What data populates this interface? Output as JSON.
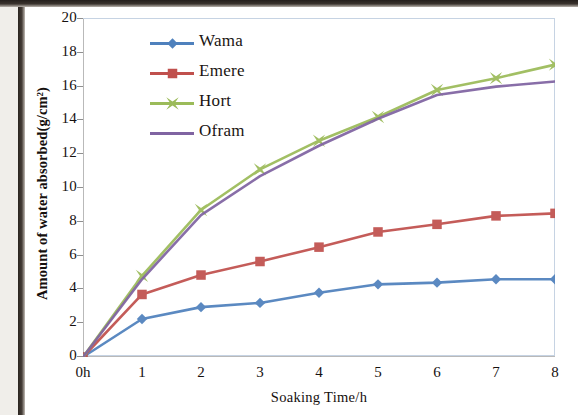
{
  "chart_data": {
    "type": "line",
    "title": "",
    "xlabel": "Soaking Time/h",
    "ylabel": "Amount of water absorbed(g/cm²)",
    "x": [
      0,
      1,
      2,
      3,
      4,
      5,
      6,
      7,
      8
    ],
    "xtick_labels": [
      "0h",
      "1",
      "2",
      "3",
      "4",
      "5",
      "6",
      "7",
      "8"
    ],
    "ytick_labels": [
      "0",
      "2",
      "4",
      "6",
      "8",
      "10",
      "12",
      "14",
      "16",
      "18",
      "20"
    ],
    "ylim": [
      0,
      20
    ],
    "xlim": [
      0,
      8
    ],
    "ystep": 2,
    "grid": false,
    "legend_position": "upper-left-inside",
    "series": [
      {
        "name": "Wama",
        "color": "#4F81BD",
        "marker": "diamond",
        "values": [
          0,
          2.25,
          2.95,
          3.2,
          3.8,
          4.3,
          4.4,
          4.6,
          4.6
        ]
      },
      {
        "name": "Emere",
        "color": "#C0504D",
        "marker": "square",
        "values": [
          0,
          3.7,
          4.85,
          5.65,
          6.5,
          7.4,
          7.85,
          8.35,
          8.5
        ]
      },
      {
        "name": "Hort",
        "color": "#9BBB59",
        "marker": "star",
        "values": [
          0,
          4.8,
          8.7,
          11.1,
          12.8,
          14.2,
          15.8,
          16.5,
          17.3
        ]
      },
      {
        "name": "Ofram",
        "color": "#8064A2",
        "marker": "none",
        "values": [
          0,
          4.6,
          8.4,
          10.7,
          12.5,
          14.1,
          15.5,
          16.0,
          16.3
        ]
      }
    ]
  },
  "legend": {
    "items": [
      {
        "label": "Wama"
      },
      {
        "label": "Emere"
      },
      {
        "label": "Hort"
      },
      {
        "label": "Ofram"
      }
    ]
  },
  "axes": {
    "x_title": "Soaking Time/h",
    "y_title": "Amount of water absorbed(g/cm²)"
  },
  "colors": {
    "series_blue": "#4F81BD",
    "series_red": "#C0504D",
    "series_green": "#9BBB59",
    "series_purple": "#8064A2",
    "plot_border": "#C6D3E3",
    "text": "#16110F"
  }
}
